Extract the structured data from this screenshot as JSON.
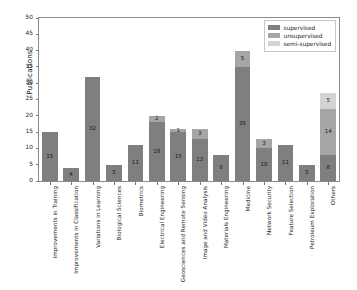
{
  "chart_data": {
    "type": "bar",
    "subtype": "stacked-bar",
    "title": "",
    "xlabel": "",
    "ylabel": "Publications",
    "ylim": [
      0,
      50
    ],
    "yticks": [
      0,
      5,
      10,
      15,
      20,
      25,
      30,
      35,
      40,
      45,
      50
    ],
    "grid": false,
    "legend_position": "upper right",
    "categories": [
      "Improvements in Training",
      "Improvements in Classification",
      "Variations in Learning",
      "Biological Sciences",
      "Biometrics",
      "Electrical Engineering",
      "Geosciences and Remote Sensing",
      "Image and Video Analysis",
      "Materials Engineering",
      "Medicine",
      "Network Security",
      "Feature Selection",
      "Petroleum Exploration",
      "Others"
    ],
    "series": [
      {
        "name": "supervised",
        "color": "#7f7f7f",
        "values": [
          15,
          4,
          32,
          5,
          11,
          18,
          15,
          13,
          8,
          35,
          10,
          11,
          5,
          8
        ]
      },
      {
        "name": "unsupervised",
        "color": "#a6a6a6",
        "values": [
          0,
          0,
          0,
          0,
          0,
          2,
          1,
          3,
          0,
          5,
          3,
          0,
          0,
          14
        ]
      },
      {
        "name": "semi-supervised",
        "color": "#d4d4d4",
        "values": [
          0,
          0,
          0,
          0,
          0,
          0,
          0,
          0,
          0,
          0,
          0,
          0,
          0,
          5
        ]
      }
    ],
    "bar_totals": [
      15,
      4,
      32,
      5,
      11,
      20,
      16,
      16,
      8,
      40,
      13,
      11,
      5,
      27
    ]
  },
  "legend": {
    "items": [
      {
        "label": "supervised",
        "key": "supervised"
      },
      {
        "label": "unsupervised",
        "key": "unsupervised"
      },
      {
        "label": "semi-supervised",
        "key": "semi"
      }
    ]
  },
  "colors": {
    "supervised": "#7f7f7f",
    "unsupervised": "#a6a6a6",
    "semi_supervised": "#d4d4d4",
    "axis": "#8a8a8a",
    "text": "#1a1a1a",
    "background": "#ffffff"
  }
}
